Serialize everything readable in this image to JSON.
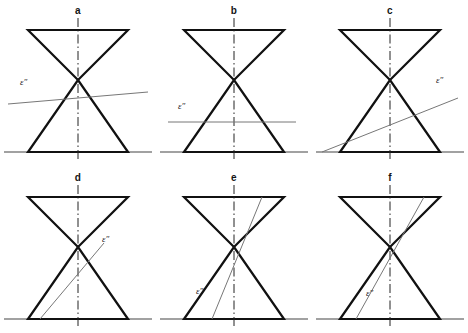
{
  "figure": {
    "background_color": "#ffffff",
    "cone_outline_color": "#111111",
    "axis_color": "#222222",
    "ground_line_color": "#444444",
    "cutting_plane_color": "#777777",
    "label_color": "#141414",
    "trace_label_text": "ε″"
  },
  "panels": [
    {
      "id": "panel-a",
      "letter": "a",
      "section_name": "point",
      "trace_label": "ε″",
      "trace_description": "cutting plane passes through the apex with a slight upward tilt to the right",
      "trace_start": [
        8,
        104
      ],
      "trace_end": [
        148,
        92
      ],
      "label_pos": [
        20,
        84
      ]
    },
    {
      "id": "panel-b",
      "letter": "b",
      "section_name": "circle",
      "trace_label": "ε″",
      "trace_description": "horizontal cutting plane below the apex, perpendicular to the axis",
      "trace_start": [
        12,
        122
      ],
      "trace_end": [
        140,
        122
      ],
      "label_pos": [
        22,
        108
      ]
    },
    {
      "id": "panel-c",
      "letter": "c",
      "section_name": "ellipse",
      "trace_label": "ε″",
      "trace_description": "oblique cutting plane rising from lower left to upper right, cutting only the lower nappe",
      "trace_start": [
        10,
        152
      ],
      "trace_end": [
        146,
        98
      ],
      "label_pos": [
        126,
        80
      ]
    },
    {
      "id": "panel-d",
      "letter": "d",
      "section_name": "hyperbola",
      "trace_label": "ε″",
      "trace_description": "steep cutting plane from the base rising to the right past the apex",
      "trace_start": [
        40,
        152
      ],
      "trace_end": [
        104,
        76
      ]
    },
    {
      "id": "panel-e",
      "letter": "e",
      "section_name": "intersecting-lines",
      "trace_label": "ε″",
      "trace_description": "steep cutting plane through the apex from the upper cone top edge down to the base",
      "trace_start": [
        106,
        30
      ],
      "trace_end": [
        56,
        152
      ]
    },
    {
      "id": "panel-f",
      "letter": "f",
      "section_name": "parabola",
      "trace_label": "ε″",
      "trace_description": "cutting plane parallel to the right generator of the cone",
      "trace_start": [
        112,
        30
      ],
      "trace_end": [
        44,
        152
      ]
    }
  ],
  "geometry": {
    "apex": [
      78,
      80
    ],
    "upper_top_left": [
      28,
      30
    ],
    "upper_top_right": [
      128,
      30
    ],
    "lower_base_left": [
      28,
      152
    ],
    "lower_base_right": [
      128,
      152
    ],
    "ground_line_start": [
      4,
      152
    ],
    "ground_line_end": [
      152,
      152
    ],
    "axis_top": [
      78,
      18
    ],
    "axis_bottom": [
      78,
      162
    ]
  }
}
